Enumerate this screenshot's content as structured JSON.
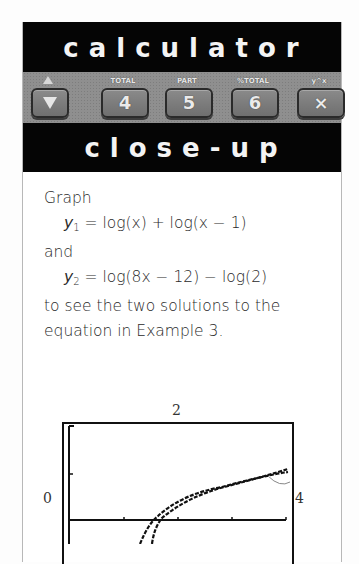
{
  "header": {
    "title": "calculator",
    "subtitle": "close-up"
  },
  "keys": [
    {
      "label": "",
      "face": "▼",
      "icon": "arrow-up-down-icon"
    },
    {
      "label": "TOTAL",
      "face": "4"
    },
    {
      "label": "PART",
      "face": "5"
    },
    {
      "label": "%TOTAL",
      "face": "6"
    },
    {
      "label": "y^x",
      "face": "×",
      "icon": "multiply-icon"
    }
  ],
  "content": {
    "intro": "Graph",
    "eq1": {
      "var": "y",
      "sub": "1",
      "rhs": " = log(x) + log(x − 1)"
    },
    "connector": "and",
    "eq2": {
      "var": "y",
      "sub": "2",
      "rhs": " = log(8x − 12) − log(2)"
    },
    "line1": "to see the two solutions to the",
    "line2": "equation in Example 3."
  },
  "graph": {
    "y_max_label": "2",
    "x_min_label": "0",
    "x_max_label": "4"
  },
  "colors": {
    "bar_bg": "#050505",
    "bar_text": "#f4f4f4",
    "keypad_bg": "#8f8f8f",
    "text": "#2a2a2a"
  }
}
